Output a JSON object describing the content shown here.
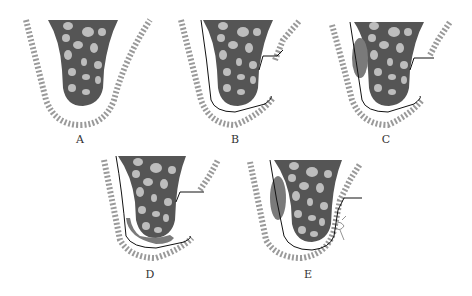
{
  "figure": {
    "panels": [
      {
        "id": "A",
        "label": "A",
        "has_sheath": false,
        "has_flap": false,
        "overlay": "none"
      },
      {
        "id": "B",
        "label": "B",
        "has_sheath": true,
        "has_flap": true,
        "overlay": "none"
      },
      {
        "id": "C",
        "label": "C",
        "has_sheath": true,
        "has_flap": true,
        "overlay": "left-oval"
      },
      {
        "id": "D",
        "label": "D",
        "has_sheath": true,
        "has_flap": true,
        "overlay": "bottom-band"
      },
      {
        "id": "E",
        "label": "E",
        "has_sheath": true,
        "has_flap": false,
        "overlay": "left-oval-and-small-structure"
      }
    ],
    "colors": {
      "core": "#555555",
      "blob": "#bdbdbd",
      "gum": "#9a9a9a",
      "overlay": "#7a7a7a",
      "line": "#111111",
      "label": "#333333"
    }
  }
}
